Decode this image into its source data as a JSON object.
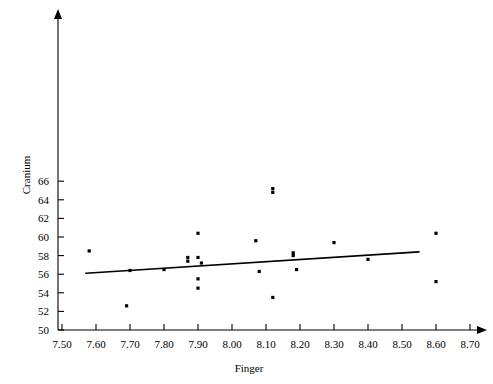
{
  "chart_data": {
    "type": "scatter",
    "title": "",
    "subtitle": "",
    "xlabel": "Finger",
    "ylabel": "Cranium",
    "xlim": [
      7.5,
      8.7
    ],
    "ylim": [
      50,
      66
    ],
    "xticks": [
      "7.50",
      "7.60",
      "7.70",
      "7.80",
      "7.90",
      "8.00",
      "8.10",
      "8.20",
      "8.30",
      "8.40",
      "8.50",
      "8.60",
      "8.70"
    ],
    "xtick_values": [
      7.5,
      7.6,
      7.7,
      7.8,
      7.9,
      8.0,
      8.1,
      8.2,
      8.3,
      8.4,
      8.5,
      8.6,
      8.7
    ],
    "yticks": [
      "50",
      "52",
      "54",
      "56",
      "58",
      "60",
      "62",
      "64",
      "66"
    ],
    "ytick_values": [
      50,
      52,
      54,
      56,
      58,
      60,
      62,
      64,
      66
    ],
    "grid": false,
    "legend": false,
    "legend_position": "none",
    "marker": "square",
    "marker_color": "#000000",
    "points": [
      {
        "x": 7.58,
        "y": 58.5
      },
      {
        "x": 7.69,
        "y": 52.6
      },
      {
        "x": 7.7,
        "y": 56.4
      },
      {
        "x": 7.8,
        "y": 56.5
      },
      {
        "x": 7.9,
        "y": 60.4
      },
      {
        "x": 7.87,
        "y": 57.8
      },
      {
        "x": 7.9,
        "y": 57.8
      },
      {
        "x": 7.87,
        "y": 57.4
      },
      {
        "x": 7.91,
        "y": 57.2
      },
      {
        "x": 7.9,
        "y": 55.5
      },
      {
        "x": 7.9,
        "y": 54.5
      },
      {
        "x": 8.07,
        "y": 59.6
      },
      {
        "x": 8.12,
        "y": 65.2
      },
      {
        "x": 8.12,
        "y": 64.8
      },
      {
        "x": 8.08,
        "y": 56.3
      },
      {
        "x": 8.12,
        "y": 53.5
      },
      {
        "x": 8.18,
        "y": 58.3
      },
      {
        "x": 8.18,
        "y": 58.0
      },
      {
        "x": 8.19,
        "y": 56.5
      },
      {
        "x": 8.3,
        "y": 59.4
      },
      {
        "x": 8.4,
        "y": 57.6
      },
      {
        "x": 8.6,
        "y": 60.4
      },
      {
        "x": 8.6,
        "y": 55.2
      }
    ],
    "fit_line": {
      "label": "least-squares regression line",
      "x_start": 7.57,
      "y_start": 56.1,
      "x_end": 8.55,
      "y_end": 58.4
    }
  },
  "axes": {
    "x_axis_name": "Finger",
    "y_axis_name": "Cranium"
  }
}
